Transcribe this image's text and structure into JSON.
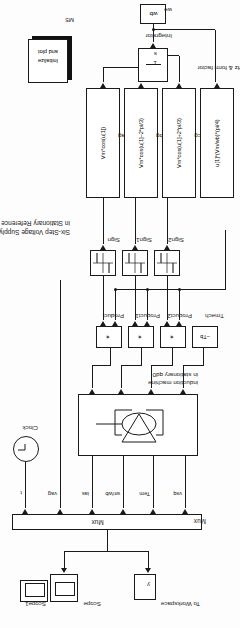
{
  "diagram": {
    "title_line1": "Six-Step Voltage Supply to Induction Machine",
    "title_line2": "in Stationary Reference Frame"
  },
  "sinks": {
    "scope1_label": "Scope1",
    "scope_label": "Scope",
    "workspace_var": "y",
    "workspace_label": "To Workspace"
  },
  "mux": {
    "icon_text": "Mux",
    "block_label": "Mux",
    "inputs": [
      {
        "signal": "t"
      },
      {
        "signal": "vag"
      },
      {
        "signal": "ias"
      },
      {
        "signal": "wr/wb"
      },
      {
        "signal": "Tem"
      },
      {
        "signal": "vsq"
      }
    ]
  },
  "clock": {
    "label": "Clock",
    "icon": "clock-icon"
  },
  "machine": {
    "label_line1": "induction machine",
    "label_line2": "in stationary qd0",
    "icon": "induction-machine-icon"
  },
  "products": [
    {
      "icon_text": "*",
      "label": "Product"
    },
    {
      "icon_text": "*",
      "label": "Product1"
    },
    {
      "icon_text": "*",
      "label": "Product2"
    }
  ],
  "tmech": {
    "expr": "–Tb",
    "label": "Tmech"
  },
  "signs": [
    {
      "label": "Sign",
      "icon": "signum-icon"
    },
    {
      "label": "Sign1",
      "icon": "signum-icon"
    },
    {
      "label": "Sign2",
      "icon": "signum-icon"
    }
  ],
  "fcns": [
    {
      "expr": "Vm*cos(u[1])",
      "label": "vag"
    },
    {
      "expr": "Vm*cos(u[1]–2*pi/3)",
      "label": "vbg"
    },
    {
      "expr": "Vm*cos(u[1]+2*pi/3)",
      "label": "vcg"
    },
    {
      "expr": "u[1]*(Vm/wb)*(pi/4)",
      "label": "V/Hz & form factor"
    }
  ],
  "integrator": {
    "numerator": "1",
    "denominator": "s",
    "label": "Integrator"
  },
  "source": {
    "value": "wb",
    "label": "we"
  },
  "init_block": {
    "line1": "Initialize",
    "line2": "and plot",
    "label": "M5"
  },
  "colors": {
    "line": "#1a1a1a",
    "block_fill": "#ffffff",
    "page": "#fdfdfd"
  }
}
